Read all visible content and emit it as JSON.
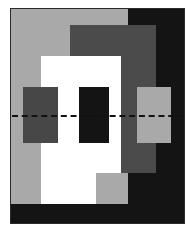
{
  "figure": {
    "canvas": {
      "width": 192,
      "height": 234,
      "background": "#ffffff"
    },
    "frame": {
      "x": 10,
      "y": 8,
      "width": 175,
      "height": 216,
      "border_color": "#2b2b2b",
      "border_width": 1
    },
    "palette": {
      "black": "#141414",
      "dark_gray": "#4b4b4b",
      "mid_gray": "#474747",
      "light_gray": "#a9a9a9",
      "white": "#ffffff",
      "axis": "#111111"
    },
    "shapes": [
      {
        "name": "black-background-region",
        "label": "black region",
        "color": "#141414",
        "x": 0,
        "y": 0,
        "width": 174,
        "height": 215
      },
      {
        "name": "light-gray-panel",
        "label": "light gray panel",
        "color": "#a9a9a9",
        "x": 0,
        "y": 0,
        "width": 117,
        "height": 195
      },
      {
        "name": "dark-gray-panel",
        "label": "dark gray panel",
        "color": "#4b4b4b",
        "x": 59,
        "y": 16,
        "width": 86,
        "height": 148
      },
      {
        "name": "white-panel-upper",
        "label": "white panel upper",
        "color": "#ffffff",
        "x": 30,
        "y": 47,
        "width": 80,
        "height": 117
      },
      {
        "name": "white-panel-lower",
        "label": "white panel lower",
        "color": "#ffffff",
        "x": 30,
        "y": 47,
        "width": 55,
        "height": 148
      },
      {
        "name": "square-left",
        "label": "left square",
        "color": "#474747",
        "x": 12,
        "y": 78,
        "width": 35,
        "height": 56
      },
      {
        "name": "square-center",
        "label": "center square",
        "color": "#141414",
        "x": 68,
        "y": 78,
        "width": 30,
        "height": 56
      },
      {
        "name": "square-right",
        "label": "right square",
        "color": "#a9a9a9",
        "x": 126,
        "y": 78,
        "width": 34,
        "height": 56
      }
    ],
    "axis_line": {
      "name": "dashed-center-axis",
      "label": "dashed centerline",
      "color": "#111111",
      "x": 1,
      "y": 106,
      "width": 172,
      "dash": "2px dashed",
      "thickness": 2
    }
  }
}
